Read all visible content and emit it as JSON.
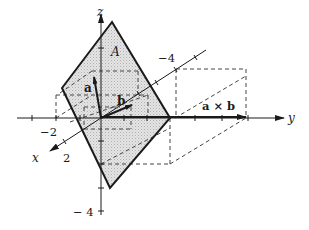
{
  "figure": {
    "axes": {
      "x_label": "x",
      "y_label": "y",
      "z_label": "z"
    },
    "tick_labels": {
      "y_neg2": "−2",
      "x_pos2": "2",
      "x_neg4": "−4",
      "z_neg4": "− 4"
    },
    "plane_label": "A",
    "vectors": {
      "a": "a",
      "b": "b",
      "cross": "a × b"
    },
    "colors": {
      "ink": "#1a1a1a",
      "plane_fill": "#d9d9d9",
      "dash": "#444444"
    }
  }
}
